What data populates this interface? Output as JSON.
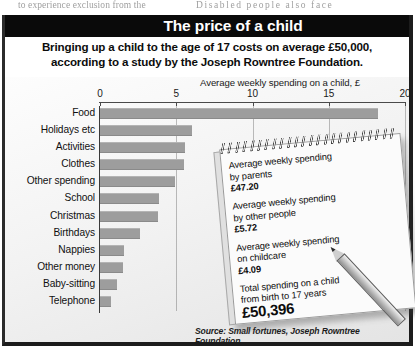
{
  "bleed_text": {
    "left": "to experience exclusion from the",
    "right": "Disabled  people  also  face"
  },
  "header": {
    "title": "The price of a child",
    "deck_line1": "Bringing up a child to the age of 17 costs on average £50,000,",
    "deck_line2": "according to a study by the Joseph Rowntree Foundation."
  },
  "source": "Source: Small fortunes, Joseph Rowntree Foundation",
  "notepad": {
    "items": [
      {
        "label_line1": "Average weekly spending",
        "label_line2": "by parents",
        "amount": "£47.20",
        "big": false
      },
      {
        "label_line1": "Average weekly spending",
        "label_line2": "by other people",
        "amount": "£5.72",
        "big": false
      },
      {
        "label_line1": "Average weekly spending",
        "label_line2": "on childcare",
        "amount": "£4.09",
        "big": false
      },
      {
        "label_line1": "Total spending on a child",
        "label_line2": "from birth to 17 years",
        "amount": "£50,396",
        "big": true
      }
    ]
  },
  "colors": {
    "bar": "#9d9d9d",
    "title_bar": "#0a0a0a",
    "title_text": "#ffffff",
    "axis": "#4a4a4a",
    "text": "#101010"
  },
  "chart_data": {
    "type": "bar",
    "orientation": "horizontal",
    "title": "The price of a child",
    "xlabel": "Average weekly spending on a child, £",
    "ylabel": "",
    "xlim": [
      0,
      20
    ],
    "ticks": [
      0,
      5,
      10,
      15,
      20
    ],
    "tick_labels": [
      "0",
      "5",
      "10",
      "15",
      "20"
    ],
    "grid": true,
    "legend": "none",
    "units": "£ per week",
    "categories": [
      "Food",
      "Holidays etc",
      "Activities",
      "Clothes",
      "Other spending",
      "School",
      "Christmas",
      "Birthdays",
      "Nappies",
      "Other money",
      "Baby-sitting",
      "Telephone"
    ],
    "values": [
      18.2,
      6.0,
      5.6,
      5.5,
      4.9,
      3.9,
      3.8,
      2.6,
      1.6,
      1.5,
      1.1,
      0.7
    ]
  }
}
